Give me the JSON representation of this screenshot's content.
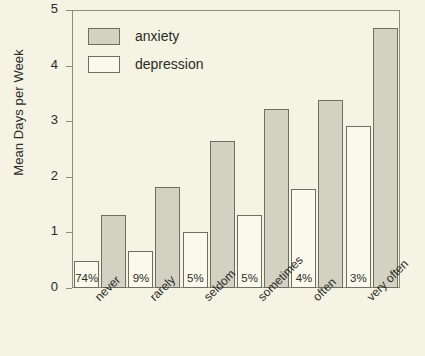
{
  "chart_data": {
    "type": "bar",
    "title": "",
    "xlabel": "",
    "ylabel": "Mean Days per Week",
    "ylim": [
      0,
      5
    ],
    "yticks": [
      0,
      1,
      2,
      3,
      4,
      5
    ],
    "grid": false,
    "legend_position": "top-left",
    "categories": [
      "never",
      "rarely",
      "seldom",
      "sometimes",
      "often",
      "very often"
    ],
    "series": [
      {
        "name": "anxiety",
        "color": "#d2d1c2",
        "values": [
          1.32,
          1.83,
          2.65,
          3.24,
          3.4,
          4.7
        ]
      },
      {
        "name": "depression",
        "color": "#faf9ec",
        "values": [
          0.49,
          0.67,
          1.02,
          1.31,
          1.79,
          2.92
        ]
      }
    ],
    "point_labels": {
      "series": "depression",
      "values": [
        "74%",
        "9%",
        "5%",
        "5%",
        "4%",
        "3%"
      ]
    }
  },
  "legend": {
    "items": [
      {
        "label": "anxiety",
        "swatch": "anxiety"
      },
      {
        "label": "depression",
        "swatch": "depression"
      }
    ]
  }
}
